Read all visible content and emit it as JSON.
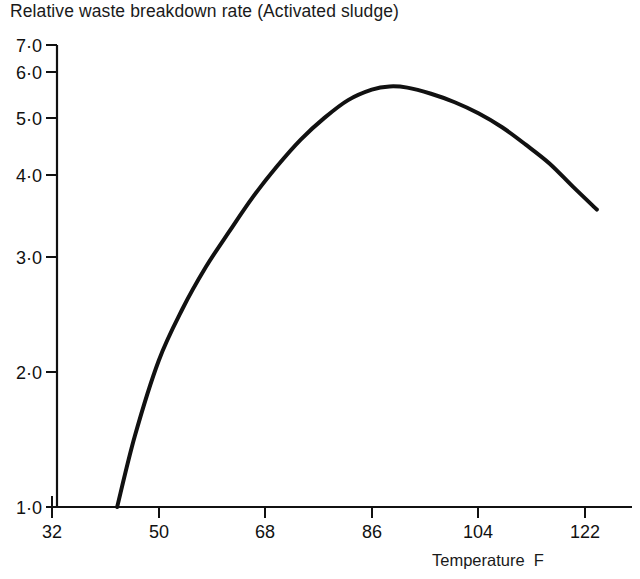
{
  "chart_data": {
    "type": "line",
    "title": "Relative waste breakdown rate (Activated sludge)",
    "xlabel": "Temperature  F",
    "ylabel": "",
    "yscale": "log",
    "grid": false,
    "legend": "none",
    "xlim": [
      32,
      130
    ],
    "ylim": [
      1.0,
      7.0
    ],
    "xticks": [
      32,
      50,
      68,
      86,
      104,
      122
    ],
    "xtick_labels": [
      "32",
      "50",
      "68",
      "86",
      "104",
      "122"
    ],
    "yticks": [
      1.0,
      2.0,
      3.0,
      4.0,
      5.0,
      6.0,
      7.0
    ],
    "ytick_labels": [
      "1·0",
      "2·0",
      "3·0",
      "4·0",
      "5·0",
      "6·0",
      "7·0"
    ],
    "series": [
      {
        "name": "Relative waste breakdown rate",
        "x": [
          43,
          46,
          50,
          54,
          58,
          62,
          66,
          70,
          74,
          78,
          82,
          86,
          89,
          92,
          96,
          100,
          104,
          108,
          112,
          116,
          120,
          124
        ],
        "y": [
          1.0,
          1.35,
          1.85,
          2.3,
          2.75,
          3.2,
          3.7,
          4.2,
          4.7,
          5.15,
          5.55,
          5.8,
          5.88,
          5.85,
          5.7,
          5.5,
          5.25,
          4.95,
          4.6,
          4.25,
          3.85,
          3.5
        ]
      }
    ],
    "annotations": []
  },
  "colors": {
    "curve": "#111111",
    "axis": "#111111",
    "text": "#1a1a1a",
    "background": "#ffffff"
  }
}
